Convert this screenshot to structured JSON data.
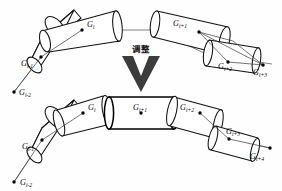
{
  "figure": {
    "background_color": "#fefefe",
    "stroke_color": "#111111",
    "axis_color": "#5a5a5a",
    "arrow_color": "#3c3c3c",
    "transition": {
      "label": "调整",
      "icon": "chevron-down-arrow"
    },
    "panels": [
      {
        "id": "before",
        "name": "before-adjustment-chain",
        "segments": [
          {
            "name": "segment-gi",
            "label_main": "G",
            "label_sub": "i"
          },
          {
            "name": "segment-gi-minus-1",
            "label_main": "G",
            "label_sub": "i-1"
          },
          {
            "name": "segment-gi-plus-1",
            "label_main": "G",
            "label_sub": "i+1"
          },
          {
            "name": "segment-gi-plus-2",
            "label_main": "G",
            "label_sub": "i+2"
          }
        ],
        "endpoints": [
          {
            "name": "endpoint-gi-minus-2",
            "label_main": "G",
            "label_sub": "i-2"
          },
          {
            "name": "endpoint-gi-plus-3",
            "label_main": "G",
            "label_sub": "i+3"
          }
        ]
      },
      {
        "id": "after",
        "name": "after-adjustment-chain",
        "segments": [
          {
            "name": "segment-gi",
            "label_main": "G",
            "label_sub": "i"
          },
          {
            "name": "segment-gi-minus-1",
            "label_main": "G",
            "label_sub": "i-1"
          },
          {
            "name": "segment-gi-plus-1",
            "label_main": "G",
            "label_sub": "i+1"
          },
          {
            "name": "segment-gi-plus-2",
            "label_main": "G",
            "label_sub": "i+2"
          },
          {
            "name": "segment-gi-plus-3",
            "label_main": "G",
            "label_sub": "i+3"
          }
        ],
        "endpoints": [
          {
            "name": "endpoint-gi-minus-2",
            "label_main": "G",
            "label_sub": "i-2"
          },
          {
            "name": "endpoint-gi-plus-4",
            "label_main": "G",
            "label_sub": "i+4"
          }
        ]
      }
    ]
  }
}
